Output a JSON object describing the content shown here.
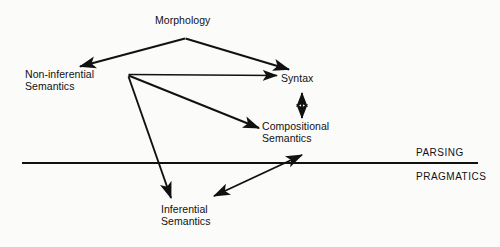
{
  "figure": {
    "kind": "linguistic-architecture-diagram",
    "background_color": "#fbfbfa",
    "ink_color": "#111111"
  },
  "nodes": {
    "morphology": {
      "label": "Morphology"
    },
    "non_inferential_semantics": {
      "line1": "Non-inferential",
      "line2": "Semantics"
    },
    "syntax": {
      "label": "Syntax"
    },
    "compositional_semantics": {
      "line1": "Compositional",
      "line2": "Semantics"
    },
    "inferential_semantics": {
      "line1": "Inferential",
      "line2": "Semantics"
    }
  },
  "zones": {
    "above_line": "PARSING",
    "below_line": "PRAGMATICS"
  },
  "divider": {
    "x1": 22,
    "y1": 163,
    "x2": 478,
    "y2": 163
  },
  "edges": [
    {
      "name": "morphology-to-non-inferential",
      "from": "morphology",
      "to": "non_inferential_semantics",
      "heads": "single"
    },
    {
      "name": "morphology-to-syntax",
      "from": "morphology",
      "to": "syntax",
      "heads": "single"
    },
    {
      "name": "non-inferential-to-syntax",
      "from": "non_inferential_semantics",
      "to": "syntax",
      "heads": "single"
    },
    {
      "name": "non-inferential-to-compositional",
      "from": "non_inferential_semantics",
      "to": "compositional_semantics",
      "heads": "single"
    },
    {
      "name": "non-inferential-to-inferential",
      "from": "non_inferential_semantics",
      "to": "inferential_semantics",
      "heads": "single"
    },
    {
      "name": "syntax-compositional-bidirectional",
      "from": "syntax",
      "to": "compositional_semantics",
      "heads": "double"
    },
    {
      "name": "inferential-compositional-bidirectional",
      "from": "inferential_semantics",
      "to": "compositional_semantics",
      "heads": "double"
    }
  ]
}
